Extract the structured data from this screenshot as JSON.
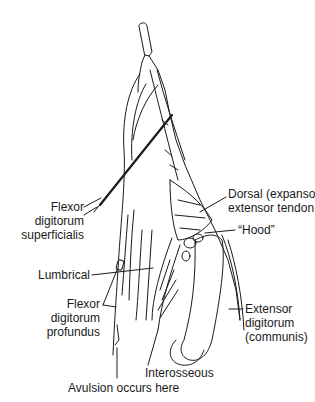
{
  "figure": {
    "type": "anatomical line drawing"
  },
  "labels": {
    "fds": "Flexor\ndigitorum\nsuperficialis",
    "dorsal": "Dorsal (expansor)\nextensor tendon",
    "hood": "“Hood”",
    "lumbrical": "Lumbrical",
    "fdp": "Flexor\ndigitorum\nprofundus",
    "extensor": "Extensor\ndigitorum\n(communis)",
    "interosseous": "Interosseous",
    "avulsion": "Avulsion occurs here"
  },
  "colors": {
    "ink": "#1a1a1a",
    "background": "#ffffff"
  }
}
